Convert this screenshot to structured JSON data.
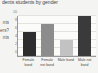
{
  "title": "dents students by gender",
  "left_cropped_text": [
    "nts",
    "ers?",
    "nts"
  ],
  "chart_data": {
    "type": "bar",
    "title": "dents students by gender",
    "xlabel": "",
    "ylabel": "",
    "categories": [
      "Female band",
      "Female not band",
      "Male band",
      "Male not band"
    ],
    "values": [
      6,
      8,
      4,
      10
    ],
    "ylim": [
      0,
      10
    ],
    "yticks": [
      "0",
      "2",
      "4",
      "6",
      "8",
      "10"
    ],
    "grid": true,
    "legend": "none",
    "colors": [
      "#2e2e2e",
      "#8c8c8c",
      "#c2c2c2",
      "#3a3a3a"
    ]
  }
}
